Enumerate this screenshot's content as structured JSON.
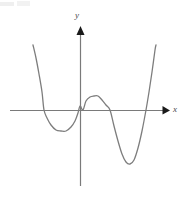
{
  "figure": {
    "title": "",
    "background_color": "#ffffff",
    "width": 186,
    "height": 199
  },
  "axes": {
    "x": {
      "label": "x",
      "color": "#7a7a7a",
      "arrow_color": "#1a1a1a",
      "line_y": 110,
      "line_x_start": 10,
      "line_x_end": 162,
      "arrow_tip_x": 170
    },
    "y": {
      "label": "y",
      "color": "#7a7a7a",
      "arrow_color": "#1a1a1a",
      "line_x": 80,
      "line_y_start": 186,
      "line_y_end": 34,
      "arrow_tip_y": 26
    },
    "origin": {
      "x": 80,
      "y": 110
    }
  },
  "chart_data": {
    "type": "line",
    "title": "",
    "xlabel": "x",
    "ylabel": "y",
    "grid": false,
    "legend": null,
    "axis_ticks": [],
    "curve_color": "#7d7d7d",
    "curve_width": 1.3,
    "features": {
      "x_intercepts_px": [
        44,
        83,
        110,
        146
      ],
      "local_minima_px": [
        [
          64,
          131
        ],
        [
          128,
          164
        ]
      ],
      "local_maxima_px": [
        [
          97,
          96
        ]
      ],
      "y_intercept_px": [
        80,
        106
      ],
      "end_behavior": "up on both ends"
    },
    "points_px": [
      [
        33,
        45
      ],
      [
        36,
        58
      ],
      [
        39,
        74
      ],
      [
        42,
        92
      ],
      [
        44,
        110
      ],
      [
        47,
        118
      ],
      [
        51,
        125
      ],
      [
        56,
        130
      ],
      [
        61,
        131
      ],
      [
        66,
        131
      ],
      [
        71,
        127
      ],
      [
        75,
        121
      ],
      [
        78,
        113
      ],
      [
        80,
        106
      ],
      [
        83,
        110
      ],
      [
        86,
        101
      ],
      [
        90,
        97
      ],
      [
        94,
        96
      ],
      [
        98,
        96
      ],
      [
        102,
        100
      ],
      [
        106,
        105
      ],
      [
        110,
        110
      ],
      [
        114,
        126
      ],
      [
        118,
        141
      ],
      [
        122,
        154
      ],
      [
        126,
        162
      ],
      [
        130,
        164
      ],
      [
        134,
        160
      ],
      [
        138,
        148
      ],
      [
        142,
        131
      ],
      [
        146,
        110
      ],
      [
        149,
        92
      ],
      [
        152,
        72
      ],
      [
        155,
        50
      ],
      [
        156,
        45
      ]
    ]
  }
}
